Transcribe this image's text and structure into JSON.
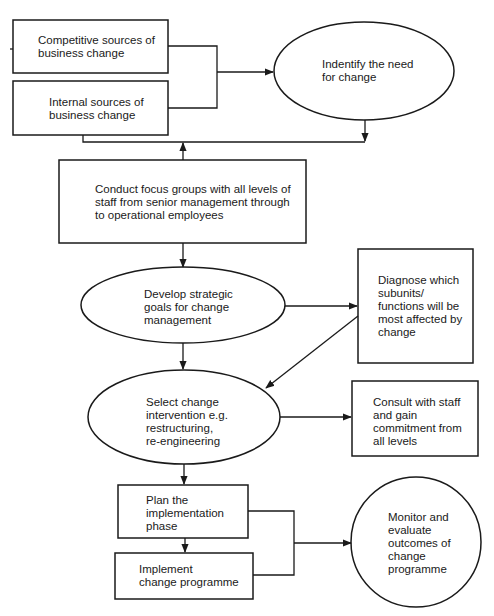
{
  "diagram": {
    "type": "flowchart",
    "colors": {
      "stroke": "#1a1a1a",
      "fill": "#ffffff",
      "background": "#ffffff"
    },
    "nodes": {
      "competitive_sources": {
        "shape": "rectangle",
        "text": "Competitive sources of\nbusiness change"
      },
      "internal_sources": {
        "shape": "rectangle",
        "text": "Internal sources of\nbusiness change"
      },
      "identify_need": {
        "shape": "ellipse",
        "text": "Indentify the need\nfor change"
      },
      "focus_groups": {
        "shape": "rectangle",
        "text": "Conduct focus groups with all levels of\nstaff from senior management through\nto operational employees"
      },
      "strategic_goals": {
        "shape": "ellipse",
        "text": "Develop strategic\ngoals for change\nmanagement"
      },
      "diagnose_subunits": {
        "shape": "rectangle",
        "text": "Diagnose which\nsubunits/\nfunctions will be\nmost affected by\nchange"
      },
      "select_intervention": {
        "shape": "ellipse",
        "text": "Select change\nintervention e.g.\nrestructuring,\nre-engineering"
      },
      "consult_staff": {
        "shape": "rectangle",
        "text": "Consult with staff\nand gain\ncommitment from\nall levels"
      },
      "plan_implementation": {
        "shape": "rectangle",
        "text": "Plan the\nimplementation\nphase"
      },
      "implement_programme": {
        "shape": "rectangle",
        "text": "Implement\nchange programme"
      },
      "monitor_evaluate": {
        "shape": "circle",
        "text": "Monitor and\nevaluate\noutcomes of\nchange\nprogramme"
      }
    },
    "edges": [
      {
        "from": "competitive_sources",
        "to": "identify_need"
      },
      {
        "from": "internal_sources",
        "to": "identify_need"
      },
      {
        "from": "identify_need",
        "to": "focus_groups"
      },
      {
        "from": "internal_sources",
        "to": "focus_groups"
      },
      {
        "from": "focus_groups",
        "to": "strategic_goals"
      },
      {
        "from": "strategic_goals",
        "to": "diagnose_subunits"
      },
      {
        "from": "strategic_goals",
        "to": "select_intervention"
      },
      {
        "from": "diagnose_subunits",
        "to": "select_intervention"
      },
      {
        "from": "select_intervention",
        "to": "consult_staff"
      },
      {
        "from": "select_intervention",
        "to": "plan_implementation"
      },
      {
        "from": "plan_implementation",
        "to": "implement_programme"
      },
      {
        "from": "plan_implementation",
        "to": "monitor_evaluate"
      },
      {
        "from": "implement_programme",
        "to": "monitor_evaluate"
      }
    ]
  }
}
